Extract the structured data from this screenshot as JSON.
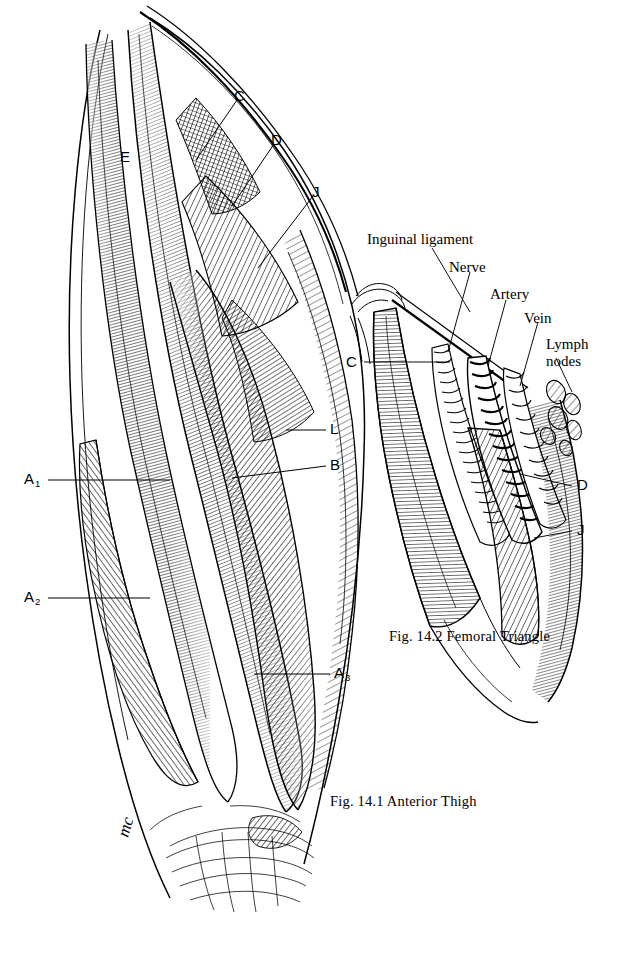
{
  "page": {
    "background": "#ffffff",
    "ink": "#000000"
  },
  "figures": [
    {
      "id": "fig-14-1",
      "caption": "Fig. 14.1   Anterior Thigh",
      "caption_number": "Fig. 14.1",
      "caption_title": "Anterior Thigh",
      "labels": [
        {
          "key": "C",
          "text": "C",
          "style": "letter"
        },
        {
          "key": "D",
          "text": "D",
          "style": "letter"
        },
        {
          "key": "E",
          "text": "E",
          "style": "letter"
        },
        {
          "key": "J",
          "text": "J",
          "style": "letter"
        },
        {
          "key": "L",
          "text": "L",
          "style": "letter"
        },
        {
          "key": "B",
          "text": "B",
          "style": "letter"
        },
        {
          "key": "A1",
          "text": "A",
          "subscript": "1",
          "style": "letter-sub"
        },
        {
          "key": "A2",
          "text": "A",
          "subscript": "2",
          "style": "letter-sub"
        },
        {
          "key": "A3",
          "text": "A",
          "subscript": "3",
          "style": "letter-sub"
        }
      ],
      "signature": "mc"
    },
    {
      "id": "fig-14-2",
      "caption": "Fig. 14.2   Femoral Triangle",
      "caption_number": "Fig. 14.2",
      "caption_title": "Femoral Triangle",
      "labels": [
        {
          "key": "inguinal",
          "text": "Inguinal ligament",
          "style": "word"
        },
        {
          "key": "nerve",
          "text": "Nerve",
          "style": "word"
        },
        {
          "key": "artery",
          "text": "Artery",
          "style": "word"
        },
        {
          "key": "vein",
          "text": "Vein",
          "style": "word"
        },
        {
          "key": "lymph1",
          "text": "Lymph",
          "style": "word"
        },
        {
          "key": "lymph2",
          "text": "nodes",
          "style": "word"
        },
        {
          "key": "C",
          "text": "C",
          "style": "letter"
        },
        {
          "key": "D",
          "text": "D",
          "style": "letter"
        },
        {
          "key": "J",
          "text": "J",
          "style": "letter"
        }
      ]
    }
  ]
}
